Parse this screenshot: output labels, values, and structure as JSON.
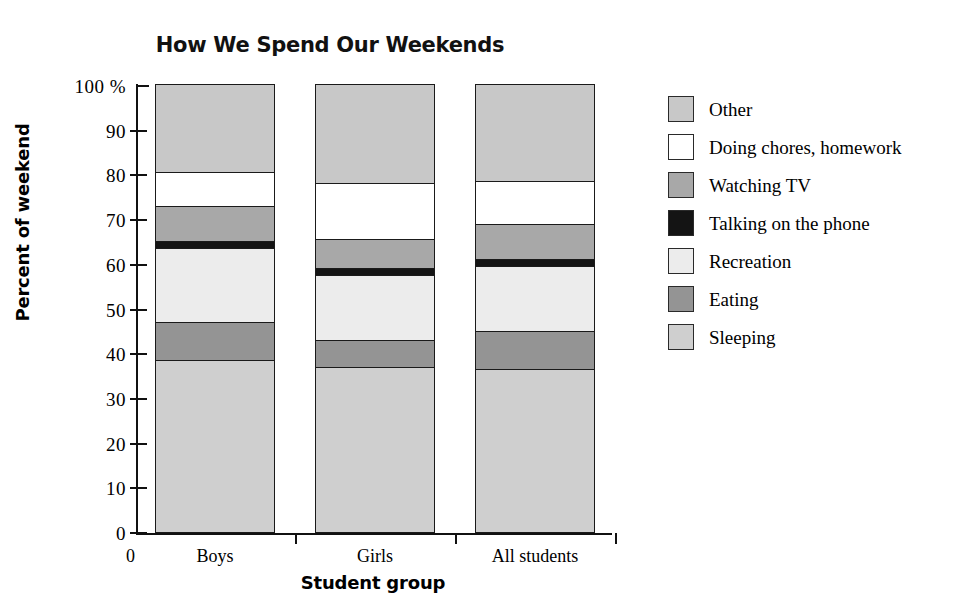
{
  "chart_data": {
    "type": "bar",
    "title": "How We Spend Our Weekends",
    "xlabel": "Student group",
    "ylabel": "Percent of weekend",
    "stacked": true,
    "grid": false,
    "legend_position": "right",
    "categories": [
      "Boys",
      "Girls",
      "All students"
    ],
    "x_origin_label": "0",
    "ylim": [
      0,
      100
    ],
    "yticks": [
      0,
      10,
      20,
      30,
      40,
      50,
      60,
      70,
      80,
      90,
      100
    ],
    "ytick_labels": [
      "0",
      "10",
      "20",
      "30",
      "40",
      "50",
      "60",
      "70",
      "80",
      "90",
      "100 %"
    ],
    "series": [
      {
        "name": "Sleeping",
        "color": "#cfcfcf",
        "values": [
          38.5,
          37.0,
          36.5
        ]
      },
      {
        "name": "Eating",
        "color": "#949494",
        "values": [
          8.5,
          6.0,
          8.5
        ]
      },
      {
        "name": "Recreation",
        "color": "#ececec",
        "values": [
          16.5,
          14.5,
          14.5
        ]
      },
      {
        "name": "Talking on the phone",
        "color": "#141414",
        "values": [
          1.5,
          1.5,
          1.5
        ]
      },
      {
        "name": "Watching TV",
        "color": "#a8a8a8",
        "values": [
          8.0,
          6.5,
          8.0
        ]
      },
      {
        "name": "Doing chores, homework",
        "color": "#ffffff",
        "values": [
          7.5,
          12.5,
          9.5
        ]
      },
      {
        "name": "Other",
        "color": "#c8c8c8",
        "values": [
          19.5,
          22.0,
          21.5
        ]
      }
    ]
  },
  "legend": {
    "entries": [
      {
        "label": "Other",
        "color": "#c8c8c8"
      },
      {
        "label": "Doing chores, homework",
        "color": "#ffffff"
      },
      {
        "label": "Watching TV",
        "color": "#a8a8a8"
      },
      {
        "label": "Talking on the phone",
        "color": "#141414"
      },
      {
        "label": "Recreation",
        "color": "#ececec"
      },
      {
        "label": "Eating",
        "color": "#949494"
      },
      {
        "label": "Sleeping",
        "color": "#cfcfcf"
      }
    ]
  }
}
